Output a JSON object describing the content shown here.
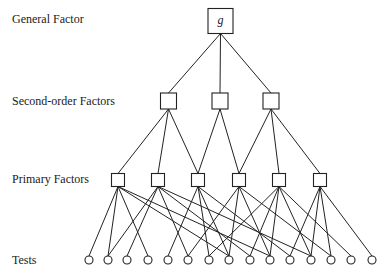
{
  "diagram": {
    "type": "hierarchical-factor-model",
    "levels": [
      {
        "id": "general",
        "label": "General Factor"
      },
      {
        "id": "second",
        "label": "Second-order Factors"
      },
      {
        "id": "primary",
        "label": "Primary Factors"
      },
      {
        "id": "tests",
        "label": "Tests"
      }
    ],
    "nodes": {
      "general": [
        {
          "id": "g",
          "label": "g"
        }
      ],
      "second": [
        {
          "id": "S1",
          "label": ""
        },
        {
          "id": "S2",
          "label": ""
        },
        {
          "id": "S3",
          "label": ""
        }
      ],
      "primary": [
        {
          "id": "P1",
          "label": ""
        },
        {
          "id": "P2",
          "label": ""
        },
        {
          "id": "P3",
          "label": ""
        },
        {
          "id": "P4",
          "label": ""
        },
        {
          "id": "P5",
          "label": ""
        },
        {
          "id": "P6",
          "label": ""
        }
      ],
      "tests": [
        {
          "id": "T1"
        },
        {
          "id": "T2"
        },
        {
          "id": "T3"
        },
        {
          "id": "T4"
        },
        {
          "id": "T5"
        },
        {
          "id": "T6"
        },
        {
          "id": "T7"
        },
        {
          "id": "T8"
        },
        {
          "id": "T9"
        },
        {
          "id": "T10"
        },
        {
          "id": "T11"
        },
        {
          "id": "T12"
        },
        {
          "id": "T13"
        },
        {
          "id": "T14"
        },
        {
          "id": "T15"
        }
      ]
    },
    "edges": [
      [
        "g",
        "S1"
      ],
      [
        "g",
        "S2"
      ],
      [
        "g",
        "S3"
      ],
      [
        "S1",
        "P1"
      ],
      [
        "S1",
        "P2"
      ],
      [
        "S1",
        "P3"
      ],
      [
        "S2",
        "P3"
      ],
      [
        "S2",
        "P4"
      ],
      [
        "S3",
        "P4"
      ],
      [
        "S3",
        "P5"
      ],
      [
        "S3",
        "P6"
      ],
      [
        "P1",
        "T1"
      ],
      [
        "P1",
        "T2"
      ],
      [
        "P1",
        "T4"
      ],
      [
        "P1",
        "T8"
      ],
      [
        "P1",
        "T10"
      ],
      [
        "P2",
        "T2"
      ],
      [
        "P2",
        "T3"
      ],
      [
        "P2",
        "T6"
      ],
      [
        "P2",
        "T9"
      ],
      [
        "P2",
        "T12"
      ],
      [
        "P3",
        "T5"
      ],
      [
        "P3",
        "T7"
      ],
      [
        "P3",
        "T8"
      ],
      [
        "P3",
        "T11"
      ],
      [
        "P4",
        "T6"
      ],
      [
        "P4",
        "T8"
      ],
      [
        "P4",
        "T10"
      ],
      [
        "P4",
        "T13"
      ],
      [
        "P5",
        "T7"
      ],
      [
        "P5",
        "T9"
      ],
      [
        "P5",
        "T10"
      ],
      [
        "P5",
        "T12"
      ],
      [
        "P6",
        "T11"
      ],
      [
        "P6",
        "T12"
      ],
      [
        "P6",
        "T13"
      ],
      [
        "P6",
        "T15"
      ],
      [
        "P5",
        "T14"
      ]
    ]
  }
}
